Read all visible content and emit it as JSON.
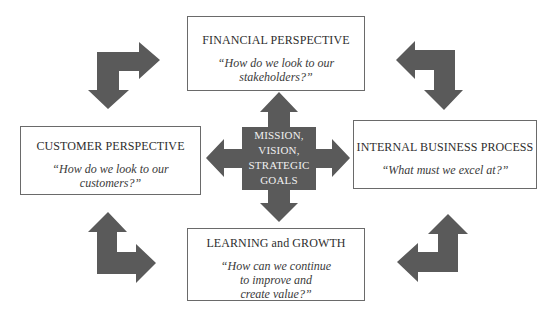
{
  "diagram": {
    "type": "balanced-scorecard",
    "colors": {
      "arrow_fill": "#5a5a5a",
      "box_border": "#6a6a6a",
      "center_text": "#f0f0f0",
      "background": "#ffffff"
    },
    "center": {
      "label": "MISSION,\nVISION,\nSTRATEGIC\nGOALS"
    },
    "perspectives": {
      "financial": {
        "title": "FINANCIAL PERSPECTIVE",
        "question": "“How do we look to our\nstakeholders?”"
      },
      "customer": {
        "title": "CUSTOMER PERSPECTIVE",
        "question": "“How do we look to our\ncustomers?”"
      },
      "internal": {
        "title": "INTERNAL BUSINESS PROCESS",
        "question": "“What must we excel at?”"
      },
      "learning": {
        "title": "LEARNING and GROWTH",
        "question": "“How can we continue\nto improve and\ncreate value?”"
      }
    },
    "connectors": [
      {
        "position": "top-left",
        "shape": "elbow-arrow",
        "directions": [
          "right",
          "down"
        ]
      },
      {
        "position": "top-right",
        "shape": "elbow-arrow",
        "directions": [
          "left",
          "down"
        ]
      },
      {
        "position": "bottom-left",
        "shape": "elbow-arrow",
        "directions": [
          "up",
          "right"
        ]
      },
      {
        "position": "bottom-right",
        "shape": "elbow-arrow",
        "directions": [
          "up",
          "left"
        ]
      }
    ]
  }
}
